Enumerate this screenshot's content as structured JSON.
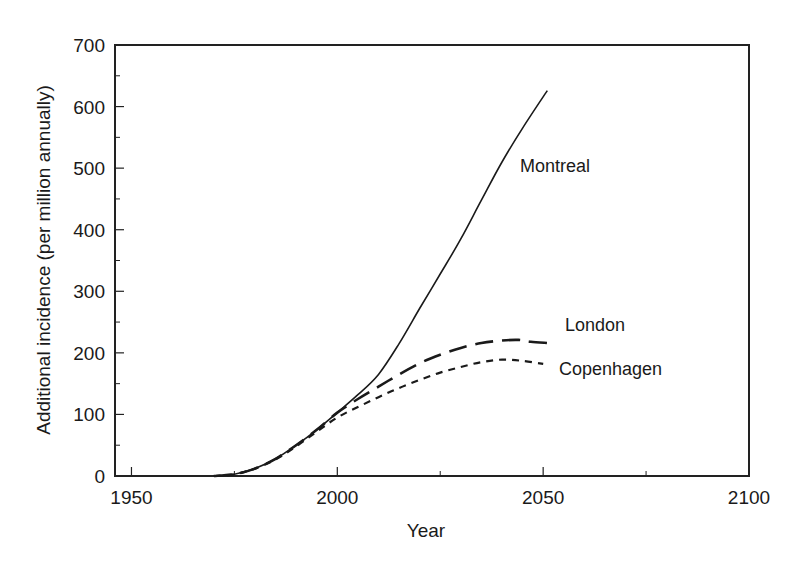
{
  "chart_data": {
    "type": "line",
    "title": "",
    "xlabel": "Year",
    "ylabel": "Additional incidence (per million annually)",
    "xlim": [
      1946,
      2100
    ],
    "ylim": [
      0,
      700
    ],
    "xticks": [
      1950,
      2000,
      2050,
      2100
    ],
    "xtick_labels": [
      "1950",
      "2000",
      "2050",
      "2100"
    ],
    "x_minor_ticks": [
      1975,
      2025,
      2075
    ],
    "yticks": [
      0,
      100,
      200,
      300,
      400,
      500,
      600,
      700
    ],
    "ytick_labels": [
      "0",
      "100",
      "200",
      "300",
      "400",
      "500",
      "600",
      "700"
    ],
    "y_minor_ticks": [
      50,
      150,
      250,
      350,
      450,
      550,
      650
    ],
    "grid": false,
    "legend": "inline labels at curve ends",
    "series": [
      {
        "name": "Montreal",
        "style": "solid",
        "x": [
          1970,
          1975,
          1980,
          1985,
          1990,
          1995,
          2000,
          2005,
          2010,
          2015,
          2020,
          2025,
          2030,
          2035,
          2040,
          2045,
          2051
        ],
        "values": [
          0,
          3,
          12,
          28,
          50,
          75,
          103,
          132,
          165,
          215,
          272,
          328,
          385,
          448,
          510,
          565,
          626
        ]
      },
      {
        "name": "London",
        "style": "long-dash",
        "x": [
          1970,
          1975,
          1980,
          1985,
          1990,
          1995,
          2000,
          2005,
          2010,
          2015,
          2020,
          2025,
          2030,
          2035,
          2040,
          2044,
          2047,
          2051
        ],
        "values": [
          0,
          3,
          12,
          28,
          50,
          75,
          103,
          125,
          145,
          165,
          183,
          197,
          208,
          216,
          220,
          221,
          218,
          216
        ]
      },
      {
        "name": "Copenhagen",
        "style": "short-dash",
        "x": [
          1970,
          1975,
          1980,
          1985,
          1990,
          1995,
          2000,
          2005,
          2010,
          2015,
          2020,
          2025,
          2030,
          2035,
          2040,
          2045,
          2050
        ],
        "values": [
          0,
          3,
          12,
          27,
          48,
          72,
          95,
          112,
          128,
          143,
          156,
          168,
          177,
          185,
          189,
          187,
          182
        ]
      }
    ],
    "annotations": [
      {
        "text": "Montreal",
        "series": "Montreal"
      },
      {
        "text": "London",
        "series": "London"
      },
      {
        "text": "Copenhagen",
        "series": "Copenhagen"
      }
    ]
  }
}
